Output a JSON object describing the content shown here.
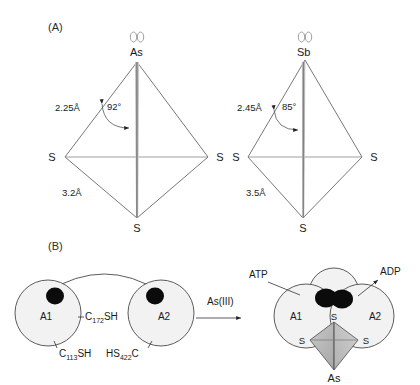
{
  "figure": {
    "panels": [
      {
        "id": "A",
        "label": "(A)"
      },
      {
        "id": "B",
        "label": "(B)"
      }
    ]
  },
  "panelA": {
    "label": "(A)",
    "structures": [
      {
        "name": "arsenic-trithiolate",
        "lone_pair_icon": "lone-pair-electrons",
        "center_atom": "As",
        "bond_length_upper": "2.25Å",
        "bond_angle": "92°",
        "bond_length_lower": "3.2Å",
        "ligand_left": "S",
        "ligand_right": "S",
        "ligand_bottom": "S"
      },
      {
        "name": "antimony-trithiolate",
        "lone_pair_icon": "lone-pair-electrons",
        "center_atom": "Sb",
        "bond_length_upper": "2.45Å",
        "bond_angle": "85°",
        "bond_length_lower": "3.5Å",
        "ligand_left": "S",
        "ligand_right": "S",
        "ligand_bottom": "S"
      }
    ]
  },
  "panelB": {
    "label": "(B)",
    "left_state": {
      "name": "apo-dimer",
      "subunit_left": "A1",
      "subunit_right": "A2",
      "cysteine_top": {
        "prefix": "C",
        "subscript": "172",
        "suffix": "SH"
      },
      "cysteine_left": {
        "prefix": "C",
        "subscript": "113",
        "suffix": "SH"
      },
      "cysteine_right": {
        "prefix": "HS",
        "subscript": "422",
        "suffix": "C"
      },
      "blob_icon": "nucleotide-binding-site"
    },
    "reaction_arrow": {
      "label": "As(III)",
      "icon": "right-arrow-icon"
    },
    "right_state": {
      "name": "as-bound-dimer",
      "subunit_left": "A1",
      "subunit_right": "A2",
      "substrate_in": "ATP",
      "substrate_out": "ADP",
      "thiolate_top": "S",
      "thiolate_left": "S",
      "thiolate_right": "S",
      "metalloid": "As",
      "blob_icon": "nucleotide-binding-site"
    }
  },
  "colors": {
    "stroke": "#4a4a4a",
    "subunit_fill": "#f2f2f2",
    "blob": "#0b0b0b",
    "pyramid_fill": "#b5b5b5",
    "spike_gray": "#9a9a9a"
  }
}
